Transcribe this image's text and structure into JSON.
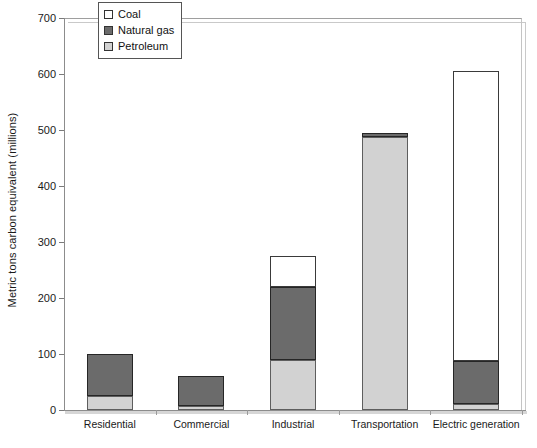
{
  "chart_data": {
    "type": "bar",
    "subtype": "stacked-bar",
    "title": "",
    "xlabel": "",
    "ylabel": "Metric tons carbon equivalent (millions)",
    "ylim": [
      0,
      700
    ],
    "yticks": [
      0,
      100,
      200,
      300,
      400,
      500,
      600,
      700
    ],
    "grid": false,
    "legend_position": "top-left-inside",
    "categories": [
      "Residential",
      "Commercial",
      "Industrial",
      "Transportation",
      "Electric generation"
    ],
    "series": [
      {
        "name": "Petroleum",
        "color": "#d2d2d2",
        "values": [
          25,
          8,
          90,
          487,
          10
        ]
      },
      {
        "name": "Natural gas",
        "color": "#6b6b6b",
        "values": [
          75,
          52,
          130,
          8,
          78
        ]
      },
      {
        "name": "Coal",
        "color": "#ffffff",
        "values": [
          0,
          0,
          55,
          0,
          517
        ]
      }
    ],
    "totals": [
      100,
      60,
      275,
      495,
      605
    ],
    "stack_order_bottom_to_top": [
      "Petroleum",
      "Natural gas",
      "Coal"
    ]
  },
  "legend": {
    "items": [
      {
        "label": "Coal",
        "swatch": "white-square-icon"
      },
      {
        "label": "Natural gas",
        "swatch": "dark-gray-square-icon"
      },
      {
        "label": "Petroleum",
        "swatch": "light-gray-square-icon"
      }
    ]
  },
  "axes": {
    "y_title": "Metric tons carbon equivalent (millions)",
    "y_tick_labels": [
      "0",
      "100",
      "200",
      "300",
      "400",
      "500",
      "600",
      "700"
    ],
    "x_tick_labels": [
      "Residential",
      "Commercial",
      "Industrial",
      "Transportation",
      "Electric generation"
    ]
  },
  "colors": {
    "coal": "#ffffff",
    "natural_gas": "#6b6b6b",
    "petroleum": "#d2d2d2",
    "axis": "#8c8c8c",
    "frame": "#c9c9c9",
    "text": "#1a1a1a"
  }
}
